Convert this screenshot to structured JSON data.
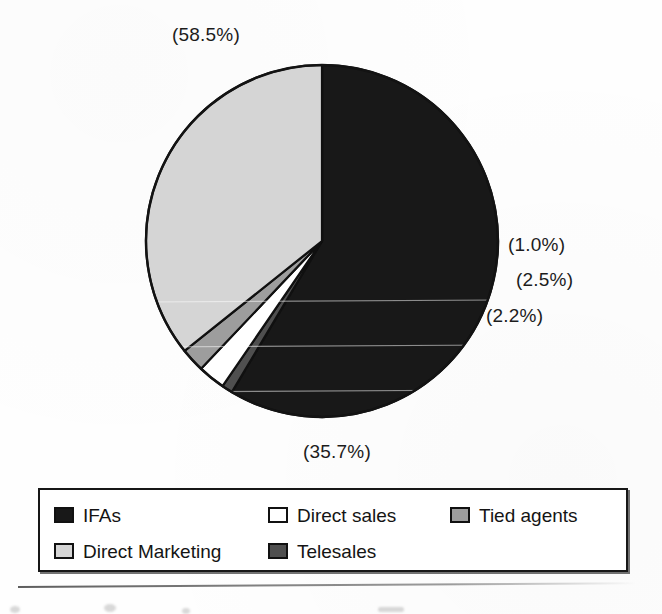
{
  "figure": {
    "type": "pie-chart-figure",
    "background_color": "#ffffff"
  },
  "chart_data": {
    "type": "pie",
    "title": "",
    "subtitle": "",
    "xlabel": "",
    "ylabel": "",
    "legend_position": "bottom",
    "grid": false,
    "value_unit": "percent",
    "label_format": "(n.n%)",
    "start_angle_deg": 0,
    "direction": "clockwise",
    "categories": [
      "IFAs",
      "Telesales",
      "Direct sales",
      "Tied agents",
      "Direct Marketing"
    ],
    "values": [
      58.5,
      1.0,
      2.5,
      2.2,
      35.7
    ],
    "slices": [
      {
        "name": "IFAs",
        "value": 58.5,
        "label": "(58.5%)",
        "color": "#181818",
        "fill_style": "solid-black",
        "label_position": "top"
      },
      {
        "name": "Telesales",
        "value": 1.0,
        "label": "(1.0%)",
        "color": "#4f4f4f",
        "fill_style": "dark-gray",
        "label_position": "right-upper"
      },
      {
        "name": "Direct sales",
        "value": 2.5,
        "label": "(2.5%)",
        "color": "#ffffff",
        "fill_style": "white",
        "label_position": "right-middle"
      },
      {
        "name": "Tied agents",
        "value": 2.2,
        "label": "(2.2%)",
        "color": "#9d9d9d",
        "fill_style": "medium-gray",
        "label_position": "right-lower"
      },
      {
        "name": "Direct Marketing",
        "value": 35.7,
        "label": "(35.7%)",
        "color": "#d5d5d5",
        "fill_style": "light-gray",
        "label_position": "bottom"
      }
    ],
    "callout_labels": [
      "(58.5%)",
      "(1.0%)",
      "(2.5%)",
      "(2.2%)",
      "(35.7%)"
    ]
  },
  "legend": {
    "border_color": "#171717",
    "entries": [
      {
        "label": "IFAs",
        "color": "#181818",
        "swatch_name": "legend-swatch-ifas"
      },
      {
        "label": "Direct sales",
        "color": "#ffffff",
        "swatch_name": "legend-swatch-direct-sales"
      },
      {
        "label": "Tied agents",
        "color": "#9d9d9d",
        "swatch_name": "legend-swatch-tied-agents"
      },
      {
        "label": "Direct Marketing",
        "color": "#d5d5d5",
        "swatch_name": "legend-swatch-direct-marketing"
      },
      {
        "label": "Telesales",
        "color": "#4f4f4f",
        "swatch_name": "legend-swatch-telesales"
      }
    ]
  },
  "geometry": {
    "center_x": 322,
    "center_y": 241,
    "radius": 176
  }
}
